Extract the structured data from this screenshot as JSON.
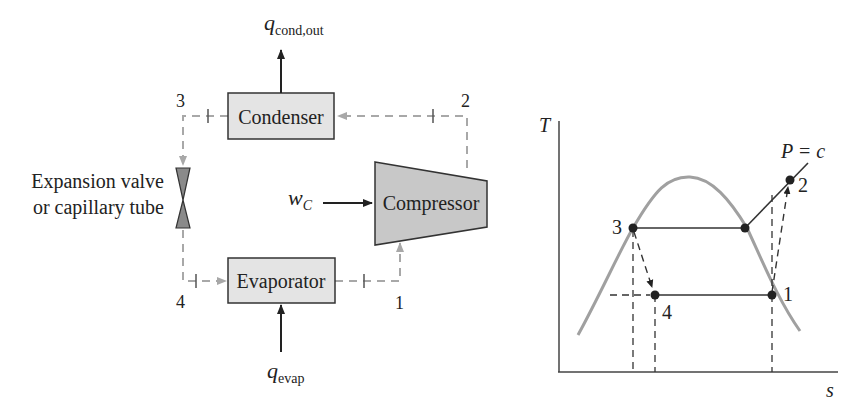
{
  "schematic": {
    "components": {
      "condenser": "Condenser",
      "compressor": "Compressor",
      "evaporator": "Evaporator",
      "expansion_valve_line1": "Expansion valve",
      "expansion_valve_line2": "or capillary tube"
    },
    "heat_flows": {
      "q_cond_out": {
        "symbol": "q",
        "subscript": "cond,out"
      },
      "q_evap": {
        "symbol": "q",
        "subscript": "evap"
      },
      "w_c": {
        "symbol": "w",
        "subscript": "C"
      }
    },
    "state_points": {
      "p1": "1",
      "p2": "2",
      "p3": "3",
      "p4": "4"
    }
  },
  "ts_diagram": {
    "y_axis_label": "T",
    "x_axis_label": "s",
    "isobar_label": "P = c",
    "state_points": {
      "p1": "1",
      "p2": "2",
      "p3": "3",
      "p4": "4"
    }
  },
  "colors": {
    "box_fill": "#e4e4e4",
    "compressor_fill": "#c8c8c8",
    "valve_fill": "#8a8a8a",
    "dashed_line": "#a8a8a8",
    "dome": "#a0a0a0",
    "ink": "#222222"
  }
}
